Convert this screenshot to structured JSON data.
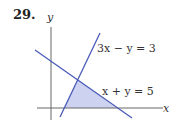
{
  "problem": {
    "number": "29."
  },
  "axes": {
    "x_label": "x",
    "y_label": "y",
    "axis_color": "#555555"
  },
  "lines": [
    {
      "equation": "3x − y = 3",
      "color": "#4a5bb8"
    },
    {
      "equation": "x + y = 5",
      "color": "#4a5bb8"
    }
  ],
  "region": {
    "fill": "#ccd2f0",
    "description": "feasible region bounded by x-axis, 3x − y = 3, and x + y = 5"
  }
}
